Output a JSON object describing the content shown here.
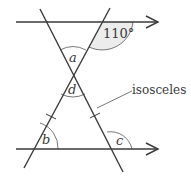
{
  "diagram": {
    "type": "geometry-parallel-lines-isosceles",
    "angle_given": "110°",
    "angle_labels": {
      "a": "a",
      "d": "d",
      "b": "b",
      "c": "c"
    },
    "annotation": "isosceles",
    "colors": {
      "line": "#3a3a3a",
      "shade": "#e6e6e6",
      "background": "#ffffff"
    }
  }
}
